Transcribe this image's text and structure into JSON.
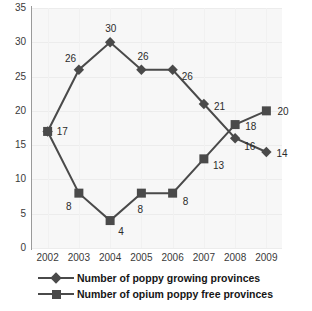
{
  "chart_data": {
    "type": "line",
    "title": "",
    "subtitle": "",
    "xlabel": "",
    "ylabel": "",
    "categories": [
      "2002",
      "2003",
      "2004",
      "2005",
      "2006",
      "2007",
      "2008",
      "2009"
    ],
    "x": [
      2002,
      2003,
      2004,
      2005,
      2006,
      2007,
      2008,
      2009
    ],
    "ylim": [
      0,
      35
    ],
    "yticks": [
      "0",
      "5",
      "10",
      "15",
      "20",
      "25",
      "30",
      "35"
    ],
    "ytick_values": [
      0,
      5,
      10,
      15,
      20,
      25,
      30,
      35
    ],
    "grid": true,
    "legend_position": "bottom",
    "series": [
      {
        "name": "Number of poppy growing provinces",
        "marker": "diamond",
        "color": "#4a4a4a",
        "values": [
          17,
          26,
          30,
          26,
          26,
          21,
          16,
          14
        ],
        "point_labels": [
          "17",
          "26",
          "30",
          "26",
          "26",
          "21",
          "16",
          "14"
        ]
      },
      {
        "name": "Number of opium poppy free provinces",
        "marker": "square",
        "color": "#4a4a4a",
        "values": [
          17,
          8,
          4,
          8,
          8,
          13,
          18,
          20
        ],
        "point_labels": [
          "17",
          "8",
          "4",
          "8",
          "8",
          "13",
          "18",
          "20"
        ]
      }
    ]
  },
  "axis": {
    "y_ticks": [
      {
        "label": "35",
        "value": 35
      },
      {
        "label": "30",
        "value": 30
      },
      {
        "label": "25",
        "value": 25
      },
      {
        "label": "20",
        "value": 20
      },
      {
        "label": "15",
        "value": 15
      },
      {
        "label": "10",
        "value": 10
      },
      {
        "label": "5",
        "value": 5
      },
      {
        "label": "0",
        "value": 0
      }
    ],
    "x_ticks": [
      {
        "label": "2002"
      },
      {
        "label": "2003"
      },
      {
        "label": "2004"
      },
      {
        "label": "2005"
      },
      {
        "label": "2006"
      },
      {
        "label": "2007"
      },
      {
        "label": "2008"
      },
      {
        "label": "2009"
      }
    ]
  },
  "legend": {
    "items": [
      {
        "label": "Number of poppy growing provinces",
        "marker": "diamond-marker-icon"
      },
      {
        "label": "Number of opium poppy free provinces",
        "marker": "square-marker-icon"
      }
    ]
  },
  "colors": {
    "series_line": "#4a4a4a",
    "plot_background": "#f7f7f7",
    "gridline": "#ececec",
    "axis_line": "#9a9a9a",
    "tick_text": "#3a3a3a",
    "label_text": "#2b2b2b",
    "legend_text": "#161616"
  }
}
